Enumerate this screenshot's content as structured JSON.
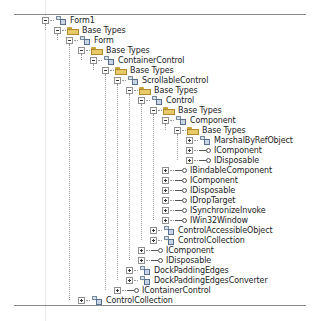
{
  "tree": {
    "rows": [
      {
        "label": "Form1",
        "kind": "class",
        "level": 0,
        "expanded": true
      },
      {
        "label": "Base Types",
        "kind": "folder",
        "level": 1,
        "expanded": true
      },
      {
        "label": "Form",
        "kind": "class",
        "level": 2,
        "expanded": true
      },
      {
        "label": "Base Types",
        "kind": "folder",
        "level": 3,
        "expanded": true
      },
      {
        "label": "ContainerControl",
        "kind": "class",
        "level": 4,
        "expanded": true
      },
      {
        "label": "Base Types",
        "kind": "folder",
        "level": 5,
        "expanded": true
      },
      {
        "label": "ScrollableControl",
        "kind": "class",
        "level": 6,
        "expanded": true
      },
      {
        "label": "Base Types",
        "kind": "folder",
        "level": 7,
        "expanded": true
      },
      {
        "label": "Control",
        "kind": "class",
        "level": 8,
        "expanded": true
      },
      {
        "label": "Base Types",
        "kind": "folder",
        "level": 9,
        "expanded": true
      },
      {
        "label": "Component",
        "kind": "class",
        "level": 10,
        "expanded": true
      },
      {
        "label": "Base Types",
        "kind": "folder",
        "level": 11,
        "expanded": true
      },
      {
        "label": "MarshalByRefObject",
        "kind": "class",
        "level": 12,
        "expanded": false
      },
      {
        "label": "IComponent",
        "kind": "interface",
        "level": 12,
        "expanded": false
      },
      {
        "label": "IDisposable",
        "kind": "interface",
        "level": 12,
        "expanded": false
      },
      {
        "label": "IBindableComponent",
        "kind": "interface",
        "level": 10,
        "expanded": false
      },
      {
        "label": "IComponent",
        "kind": "interface",
        "level": 10,
        "expanded": false
      },
      {
        "label": "IDisposable",
        "kind": "interface",
        "level": 10,
        "expanded": false
      },
      {
        "label": "IDropTarget",
        "kind": "interface",
        "level": 10,
        "expanded": false
      },
      {
        "label": "ISynchronizeInvoke",
        "kind": "interface",
        "level": 10,
        "expanded": false
      },
      {
        "label": "IWin32Window",
        "kind": "interface",
        "level": 10,
        "expanded": false
      },
      {
        "label": "ControlAccessibleObject",
        "kind": "class",
        "level": 9,
        "expanded": false
      },
      {
        "label": "ControlCollection",
        "kind": "class",
        "level": 9,
        "expanded": false
      },
      {
        "label": "IComponent",
        "kind": "interface",
        "level": 8,
        "expanded": false
      },
      {
        "label": "IDisposable",
        "kind": "interface",
        "level": 8,
        "expanded": false
      },
      {
        "label": "DockPaddingEdges",
        "kind": "class",
        "level": 7,
        "expanded": false
      },
      {
        "label": "DockPaddingEdgesConverter",
        "kind": "class",
        "level": 7,
        "expanded": false
      },
      {
        "label": "IContainerControl",
        "kind": "interface",
        "level": 6,
        "expanded": false
      },
      {
        "label": "ControlCollection",
        "kind": "class",
        "level": 3,
        "expanded": false
      }
    ]
  }
}
